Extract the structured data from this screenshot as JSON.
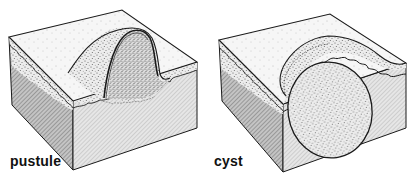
{
  "figures": [
    {
      "id": "pustule",
      "label": "pustule",
      "description": "Skin block cross-section showing a raised dome-shaped pustule elevating the epidermis"
    },
    {
      "id": "cyst",
      "label": "cyst",
      "description": "Skin block cross-section showing an oval cyst within the dermis raising the overlying epidermis"
    }
  ],
  "colors": {
    "outline": "#1a1a1a",
    "top_surface": "#f4f4f4",
    "left_face": "#a8a8a8",
    "front_face": "#d9d9d9",
    "stipple": "#555555",
    "background": "#ffffff"
  }
}
